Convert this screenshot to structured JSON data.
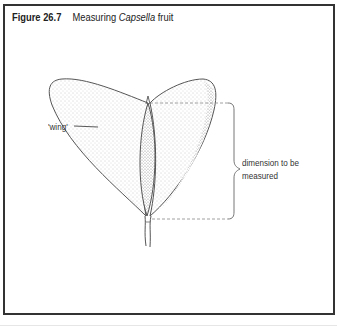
{
  "figure": {
    "number_label": "Figure 26.7",
    "caption_prefix": "Measuring",
    "caption_species": "Capsella",
    "caption_suffix": "fruit"
  },
  "labels": {
    "wing": "'wing'",
    "dimension_line1": "dimension to be",
    "dimension_line2": "measured"
  },
  "colors": {
    "frame": "#333333",
    "outline": "#555555",
    "stipple": "#9a9a9a",
    "dashed_line": "#888888"
  }
}
